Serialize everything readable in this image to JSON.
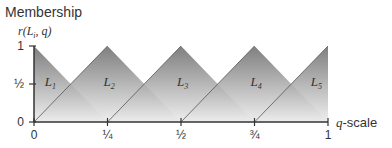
{
  "chart_data": {
    "type": "area",
    "title": "Membership",
    "ylabel": "r(L_i, q)",
    "xlabel": "q-scale",
    "x_ticks": [
      {
        "value": 0,
        "label": "0"
      },
      {
        "value": 0.25,
        "label": "¼"
      },
      {
        "value": 0.5,
        "label": "½"
      },
      {
        "value": 0.75,
        "label": "¾"
      },
      {
        "value": 1,
        "label": "1"
      }
    ],
    "y_ticks": [
      {
        "value": 0,
        "label": "0"
      },
      {
        "value": 0.5,
        "label": "½"
      },
      {
        "value": 1,
        "label": "1"
      }
    ],
    "xlim": [
      0,
      1
    ],
    "ylim": [
      0,
      1
    ],
    "grid": false,
    "series": [
      {
        "name": "L1",
        "points": [
          [
            0,
            1
          ],
          [
            0.25,
            0
          ],
          [
            0,
            0
          ]
        ]
      },
      {
        "name": "L2",
        "points": [
          [
            0,
            0
          ],
          [
            0.25,
            1
          ],
          [
            0.5,
            0
          ]
        ]
      },
      {
        "name": "L3",
        "points": [
          [
            0.25,
            0
          ],
          [
            0.5,
            1
          ],
          [
            0.75,
            0
          ]
        ]
      },
      {
        "name": "L4",
        "points": [
          [
            0.5,
            0
          ],
          [
            0.75,
            1
          ],
          [
            1,
            0
          ]
        ]
      },
      {
        "name": "L5",
        "points": [
          [
            0.75,
            0
          ],
          [
            1,
            1
          ],
          [
            1,
            0
          ]
        ]
      }
    ],
    "fill_gradient": {
      "top": "#686868",
      "bottom": "#ececec"
    }
  },
  "labels": {
    "title": "Membership",
    "ylabel": "r(L",
    "ylabel_sub": "i",
    "ylabel_end": ", q)",
    "xlabel_q": "q",
    "xlabel_rest": "-scale",
    "L": "L",
    "subs": [
      "1",
      "2",
      "3",
      "4",
      "5"
    ]
  }
}
